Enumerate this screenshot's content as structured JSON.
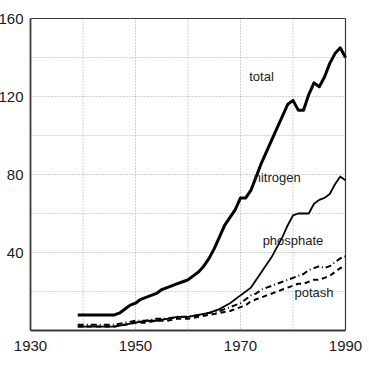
{
  "chart_data": {
    "type": "line",
    "title": "",
    "subtitle": "",
    "xlabel": "",
    "ylabel": "",
    "xlim": [
      1930,
      1990
    ],
    "ylim": [
      0,
      160
    ],
    "grid": true,
    "grid_style": "dotted",
    "legend_position": "inline-annotations",
    "x_ticks_major": [
      1930,
      1950,
      1970,
      1990
    ],
    "x_ticks_minor": [
      1940,
      1960,
      1980
    ],
    "x_tick_labels": [
      "1930",
      "1950",
      "1970",
      "1990"
    ],
    "y_ticks_major": [
      40,
      80,
      120,
      160
    ],
    "y_ticks_minor": [
      20,
      60,
      100,
      140
    ],
    "y_tick_labels": [
      "40",
      "80",
      "120",
      "160"
    ],
    "series": [
      {
        "name": "total",
        "label": "total",
        "line_style": "solid",
        "line_width": 3,
        "color": "#000000",
        "x": [
          1939,
          1940,
          1941,
          1942,
          1943,
          1944,
          1945,
          1946,
          1947,
          1948,
          1949,
          1950,
          1951,
          1952,
          1953,
          1954,
          1955,
          1956,
          1957,
          1958,
          1959,
          1960,
          1961,
          1962,
          1963,
          1964,
          1965,
          1966,
          1967,
          1968,
          1969,
          1970,
          1971,
          1972,
          1973,
          1974,
          1975,
          1976,
          1977,
          1978,
          1979,
          1980,
          1981,
          1982,
          1983,
          1984,
          1985,
          1986,
          1987,
          1988,
          1989,
          1990
        ],
        "y": [
          8,
          8,
          8,
          8,
          8,
          8,
          8,
          8,
          9,
          11,
          13,
          14,
          16,
          17,
          18,
          19,
          21,
          22,
          23,
          24,
          25,
          26,
          28,
          30,
          33,
          37,
          42,
          48,
          54,
          58,
          62,
          68,
          68,
          72,
          79,
          86,
          92,
          98,
          104,
          110,
          116,
          118,
          113,
          113,
          121,
          127,
          125,
          130,
          137,
          142,
          145,
          140
        ]
      },
      {
        "name": "nitrogen",
        "label": "nitrogen",
        "line_style": "solid",
        "line_width": 1.8,
        "color": "#000000",
        "x": [
          1939,
          1940,
          1942,
          1944,
          1946,
          1948,
          1950,
          1952,
          1954,
          1956,
          1958,
          1960,
          1962,
          1964,
          1966,
          1968,
          1970,
          1971,
          1972,
          1973,
          1974,
          1975,
          1976,
          1977,
          1978,
          1979,
          1980,
          1981,
          1982,
          1983,
          1984,
          1985,
          1986,
          1987,
          1988,
          1989,
          1990
        ],
        "y": [
          2,
          2,
          2,
          2,
          2,
          3,
          4,
          5,
          5,
          6,
          7,
          7,
          8,
          9,
          11,
          14,
          18,
          20,
          22,
          26,
          30,
          34,
          38,
          43,
          48,
          54,
          59,
          60,
          60,
          60,
          65,
          67,
          68,
          70,
          75,
          79,
          77
        ]
      },
      {
        "name": "phosphate",
        "label": "phosphate",
        "line_style": "dash-dot",
        "line_width": 2,
        "color": "#000000",
        "x": [
          1939,
          1942,
          1944,
          1946,
          1948,
          1950,
          1952,
          1954,
          1956,
          1958,
          1960,
          1962,
          1964,
          1966,
          1968,
          1970,
          1971,
          1972,
          1973,
          1974,
          1975,
          1976,
          1977,
          1978,
          1979,
          1980,
          1981,
          1982,
          1983,
          1984,
          1985,
          1986,
          1987,
          1988,
          1989,
          1990
        ],
        "y": [
          3,
          3,
          3,
          3,
          4,
          5,
          5,
          6,
          6,
          7,
          7,
          8,
          9,
          10,
          12,
          14,
          16,
          18,
          19,
          21,
          22,
          23,
          24,
          25,
          26,
          27,
          28,
          29,
          31,
          32,
          33,
          32,
          33,
          35,
          37,
          38
        ]
      },
      {
        "name": "potash",
        "label": "potash",
        "line_style": "dashed",
        "line_width": 2,
        "color": "#000000",
        "x": [
          1939,
          1942,
          1944,
          1946,
          1948,
          1950,
          1952,
          1954,
          1956,
          1958,
          1960,
          1962,
          1964,
          1966,
          1968,
          1970,
          1971,
          1972,
          1973,
          1974,
          1975,
          1976,
          1977,
          1978,
          1979,
          1980,
          1981,
          1982,
          1983,
          1984,
          1985,
          1986,
          1987,
          1988,
          1989,
          1990
        ],
        "y": [
          2,
          2,
          2,
          2,
          3,
          4,
          4,
          5,
          5,
          6,
          6,
          7,
          8,
          9,
          10,
          12,
          13,
          15,
          16,
          17,
          18,
          19,
          20,
          21,
          22,
          23,
          24,
          24,
          25,
          26,
          26,
          27,
          28,
          30,
          32,
          33
        ]
      }
    ],
    "annotations": [
      {
        "text": "total",
        "x": 1974,
        "y": 128
      },
      {
        "text": "nitrogen",
        "x": 1977,
        "y": 76
      },
      {
        "text": "phosphate",
        "x": 1980,
        "y": 44
      },
      {
        "text": "potash",
        "x": 1984,
        "y": 17
      }
    ]
  },
  "colors": {
    "line": "#000000",
    "axis": "#3a3a3a",
    "grid": "#9a9a9a",
    "background": "#ffffff",
    "text": "#1a1a1a"
  }
}
